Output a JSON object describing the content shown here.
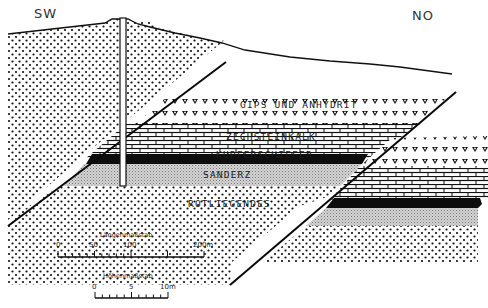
{
  "diagram": {
    "type": "geological cross-section",
    "orientation": {
      "left": "SW",
      "right": "NO"
    },
    "layers": [
      {
        "id": "gips",
        "label": "GIPS UND ANHYDRIT",
        "pattern": "v-symbols"
      },
      {
        "id": "zechsteinkalk",
        "label": "ZECHSTEINKALK",
        "pattern": "brick"
      },
      {
        "id": "kupferschiefer",
        "label": "KUPFERSCHIEFER",
        "pattern": "solid-black"
      },
      {
        "id": "sanderz",
        "label": "SANDERZ",
        "pattern": "fine-stipple"
      },
      {
        "id": "rotliegendes",
        "label": "ROTLIEGENDES",
        "pattern": "dots"
      }
    ],
    "features": [
      "drill-hole",
      "fault-left",
      "fault-right",
      "surface-line"
    ],
    "scales": {
      "length": {
        "title": "Längenmaßstab",
        "ticks": [
          "0",
          "50",
          "100",
          "200m"
        ]
      },
      "height": {
        "title": "Höhenmaßstab",
        "ticks": [
          "0",
          "5",
          "10m"
        ]
      }
    }
  }
}
